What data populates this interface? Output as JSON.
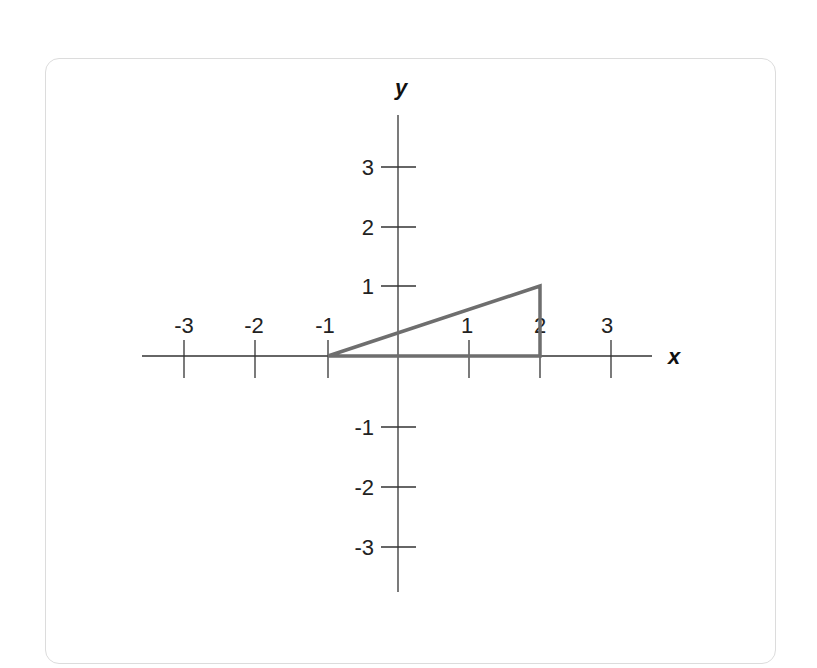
{
  "diagram": {
    "type": "coordinate-plane",
    "x_axis_label": "x",
    "y_axis_label": "y",
    "x_ticks": [
      "-3",
      "-2",
      "-1",
      "1",
      "2",
      "3"
    ],
    "y_ticks": [
      "3",
      "2",
      "1",
      "-1",
      "-2",
      "-3"
    ],
    "shape": {
      "kind": "triangle",
      "vertices": [
        [
          -1,
          0
        ],
        [
          2,
          0
        ],
        [
          2,
          1
        ]
      ],
      "stroke_color": "#6e6e6e"
    },
    "axis_color": "#333333",
    "card_border_color": "#dcdcdc"
  }
}
